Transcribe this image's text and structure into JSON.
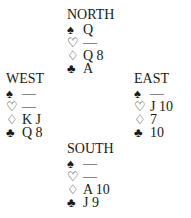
{
  "diagram": {
    "type": "bridge-deal",
    "suit_symbols": {
      "spades": "♠",
      "hearts": "♡",
      "diamonds": "♢",
      "clubs": "♣"
    },
    "hands": {
      "north": {
        "label": "NORTH",
        "spades": "Q",
        "hearts": "—",
        "diamonds": "Q 8",
        "clubs": "A"
      },
      "west": {
        "label": "WEST",
        "spades": "—",
        "hearts": "—",
        "diamonds": "K J",
        "clubs": "Q 8"
      },
      "east": {
        "label": "EAST",
        "spades": "—",
        "hearts": "J 10",
        "diamonds": "7",
        "clubs": "10"
      },
      "south": {
        "label": "SOUTH",
        "spades": "—",
        "hearts": "—",
        "diamonds": "A 10",
        "clubs": "J 9"
      }
    }
  }
}
